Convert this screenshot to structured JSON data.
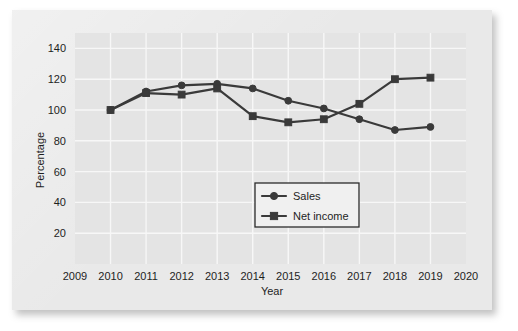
{
  "figure": {
    "card_background": "#e9e9e9",
    "plot_background": "#e4e4e4",
    "gridline_color": "#f7f7f7",
    "series_color": "#3a3a3a"
  },
  "chart_data": {
    "type": "line",
    "title": "",
    "xlabel": "Year",
    "ylabel": "Percentage",
    "x": [
      2010,
      2011,
      2012,
      2013,
      2014,
      2015,
      2016,
      2017,
      2018,
      2019
    ],
    "xtick_labels": [
      "2009",
      "2010",
      "2011",
      "2012",
      "2013",
      "2014",
      "2015",
      "2016",
      "2017",
      "2018",
      "2019",
      "2020"
    ],
    "xlim": [
      2009,
      2020
    ],
    "ytick_labels": [
      "20",
      "40",
      "60",
      "80",
      "100",
      "120",
      "140"
    ],
    "ylim": [
      0,
      150
    ],
    "yticks": [
      20,
      40,
      60,
      80,
      100,
      120,
      140
    ],
    "grid": true,
    "legend_position": "center-right-lower",
    "series": [
      {
        "name": "Sales",
        "marker": "circle",
        "values": [
          100,
          112,
          116,
          117,
          114,
          106,
          101,
          94,
          87,
          89
        ]
      },
      {
        "name": "Net income",
        "marker": "square",
        "values": [
          100,
          111,
          110,
          114,
          96,
          92,
          94,
          104,
          120,
          121
        ]
      }
    ]
  },
  "legend": {
    "entries": [
      {
        "label": "Sales",
        "marker": "circle"
      },
      {
        "label": "Net income",
        "marker": "square"
      }
    ]
  }
}
